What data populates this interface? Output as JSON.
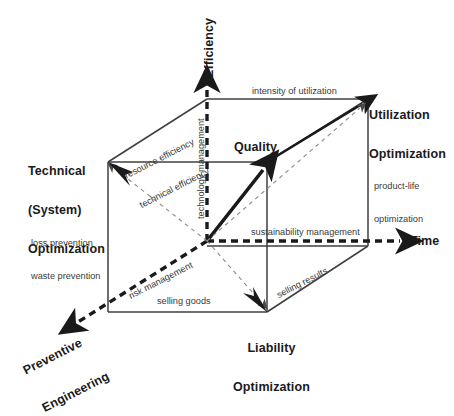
{
  "diagram": {
    "colors": {
      "ink": "#1a1a1a",
      "edge": "#3f3f3f",
      "thin_dash": "#8c8c8c",
      "background": "#ffffff"
    },
    "axes": [
      {
        "id": "efficiency",
        "label": "Efficiency",
        "direction": "up",
        "style": "thick-dashed-arrow"
      },
      {
        "id": "time",
        "label": "Time",
        "direction": "right",
        "style": "thick-dashed-arrow"
      },
      {
        "id": "preventive-engineering",
        "label": "Preventive\nEngineering",
        "direction": "down-left",
        "style": "thick-dashed-arrow"
      }
    ],
    "axis_labels": {
      "efficiency": "Efficiency",
      "time": "Time",
      "preventive_line1": "Preventive",
      "preventive_line2": "Engineering"
    },
    "vertices": [
      {
        "id": "technical-system-optimization",
        "line1": "Technical",
        "line2": "(System)",
        "line3": "Optimization"
      },
      {
        "id": "utilization-optimization",
        "line1": "Utilization",
        "line2": "Optimization"
      },
      {
        "id": "liability-optimization",
        "line1": "Liability",
        "line2": "Optimization"
      },
      {
        "id": "quality",
        "line1": "Quality"
      }
    ],
    "vertex_labels": {
      "technical_l1": "Technical",
      "technical_l2": "(System)",
      "technical_l3": "Optimization",
      "utilization_l1": "Utilization",
      "utilization_l2": "Optimization",
      "liability_l1": "Liability",
      "liability_l2": "Optimization",
      "quality": "Quality"
    },
    "edge_labels": {
      "intensity_of_utilization": "intensity of utilization",
      "resource_efficiency": "resource efficiency",
      "technical_efficiency": "technical efficiency",
      "technology_management": "technology management",
      "product_life_l1": "product-life",
      "product_life_l2": "optimization",
      "loss_prevention": "loss prevention",
      "waste_prevention": "waste prevention",
      "sustainability_management": "sustainability management",
      "risk_management": "risk management",
      "selling_goods": "selling goods",
      "selling_results": "selling results"
    }
  }
}
